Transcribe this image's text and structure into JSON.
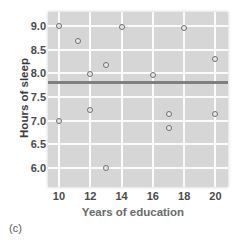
{
  "chart_data": {
    "type": "scatter",
    "title": "",
    "xlabel": "Years of education",
    "ylabel": "Hours of sleep",
    "xlim": [
      9.3,
      20.8
    ],
    "ylim": [
      5.6,
      9.3
    ],
    "xticks": [
      10,
      12,
      14,
      16,
      18,
      20
    ],
    "yticks": [
      6.0,
      6.5,
      7.0,
      7.5,
      8.0,
      8.5,
      9.0
    ],
    "xtick_labels": [
      "10",
      "12",
      "14",
      "16",
      "18",
      "20"
    ],
    "ytick_labels": [
      "6.0",
      "6.5",
      "7.0",
      "7.5",
      "8.0",
      "8.5",
      "9.0"
    ],
    "grid": true,
    "grid_color": "#fbfbfb",
    "plot_bg": "#d6d6d6",
    "marker": "open-circle",
    "marker_color": "#6e6e6e",
    "legend": null,
    "points": [
      {
        "x": 10,
        "y": 9.0
      },
      {
        "x": 10,
        "y": 7.0
      },
      {
        "x": 11.2,
        "y": 8.68
      },
      {
        "x": 12,
        "y": 7.98
      },
      {
        "x": 12,
        "y": 7.22
      },
      {
        "x": 13,
        "y": 8.18
      },
      {
        "x": 13,
        "y": 6.0
      },
      {
        "x": 14,
        "y": 8.98
      },
      {
        "x": 16,
        "y": 7.97
      },
      {
        "x": 17,
        "y": 7.15
      },
      {
        "x": 17,
        "y": 6.85
      },
      {
        "x": 18,
        "y": 8.97
      },
      {
        "x": 20,
        "y": 8.3
      },
      {
        "x": 20,
        "y": 7.15
      }
    ],
    "regression_line": {
      "type": "horizontal",
      "y": 7.8,
      "color": "#808080",
      "description": "flat fitted line showing no relationship"
    }
  },
  "panel": {
    "letter": "(c)"
  }
}
